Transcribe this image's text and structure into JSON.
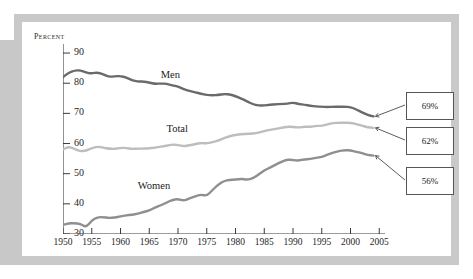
{
  "chart_data": {
    "type": "line",
    "title": "",
    "xlabel": "",
    "ylabel": "Percent",
    "xlim": [
      1950,
      2006
    ],
    "ylim": [
      30,
      93
    ],
    "ytick_labels": [
      "30",
      "40",
      "50",
      "60",
      "70",
      "80",
      "90"
    ],
    "yticks": [
      30,
      40,
      50,
      60,
      70,
      80,
      90
    ],
    "xtick_labels": [
      "1950",
      "1955",
      "1960",
      "1965",
      "1970",
      "1975",
      "1980",
      "1985",
      "1990",
      "1995",
      "2000",
      "2005"
    ],
    "xticks": [
      1950,
      1955,
      1960,
      1965,
      1970,
      1975,
      1980,
      1985,
      1990,
      1995,
      2000,
      2005
    ],
    "grid": false,
    "legend": "inline-labels",
    "x": [
      1950,
      1951,
      1952,
      1953,
      1954,
      1955,
      1956,
      1957,
      1958,
      1959,
      1960,
      1961,
      1962,
      1963,
      1964,
      1965,
      1966,
      1967,
      1968,
      1969,
      1970,
      1971,
      1972,
      1973,
      1974,
      1975,
      1976,
      1977,
      1978,
      1979,
      1980,
      1981,
      1982,
      1983,
      1984,
      1985,
      1986,
      1987,
      1988,
      1989,
      1990,
      1991,
      1992,
      1993,
      1994,
      1995,
      1996,
      1997,
      1998,
      1999,
      2000,
      2001,
      2002,
      2003,
      2004
    ],
    "series": [
      {
        "name": "Men",
        "color": "#6a6a6a",
        "label_x": 1967,
        "label_y": 82.5,
        "end_value": 69,
        "values": [
          82.0,
          83.5,
          84.2,
          84.3,
          83.5,
          83.2,
          83.6,
          82.9,
          82.1,
          82.3,
          82.4,
          81.9,
          81.0,
          80.5,
          80.6,
          80.2,
          79.8,
          79.9,
          79.8,
          79.3,
          78.9,
          78.0,
          77.4,
          77.0,
          76.5,
          76.1,
          76.0,
          76.1,
          76.4,
          76.3,
          75.7,
          74.9,
          74.0,
          73.0,
          72.6,
          72.6,
          72.9,
          73.0,
          73.1,
          73.2,
          73.6,
          73.1,
          72.9,
          72.5,
          72.3,
          72.2,
          72.1,
          72.2,
          72.2,
          72.2,
          72.1,
          71.3,
          70.4,
          69.4,
          69.0
        ]
      },
      {
        "name": "Total",
        "color": "#bdbdbd",
        "label_x": 1968,
        "label_y": 64.5,
        "end_value": 62,
        "values": [
          58.0,
          59.0,
          58.2,
          57.4,
          57.6,
          58.5,
          59.0,
          58.6,
          58.3,
          58.2,
          58.6,
          58.5,
          58.2,
          58.3,
          58.3,
          58.4,
          58.6,
          59.0,
          59.2,
          59.7,
          59.5,
          59.1,
          59.4,
          59.8,
          60.2,
          60.0,
          60.4,
          61.0,
          61.8,
          62.4,
          62.9,
          63.1,
          63.2,
          63.3,
          63.6,
          64.1,
          64.6,
          64.8,
          65.2,
          65.6,
          65.5,
          65.3,
          65.6,
          65.5,
          65.9,
          65.8,
          66.4,
          66.8,
          66.9,
          66.9,
          66.9,
          66.5,
          65.9,
          65.4,
          65.2
        ]
      },
      {
        "name": "Women",
        "color": "#8f8f8f",
        "label_x": 1963,
        "label_y": 45.5,
        "end_value": 56,
        "values": [
          33.0,
          33.5,
          33.6,
          33.4,
          32.2,
          34.5,
          35.6,
          35.6,
          35.3,
          35.5,
          35.8,
          36.2,
          36.4,
          36.7,
          37.3,
          37.8,
          38.8,
          39.5,
          40.4,
          41.3,
          41.6,
          41.0,
          41.8,
          42.5,
          43.1,
          42.6,
          44.6,
          46.4,
          47.6,
          48.0,
          48.0,
          48.3,
          48.0,
          48.4,
          49.7,
          51.1,
          52.0,
          53.0,
          54.0,
          54.7,
          54.5,
          54.3,
          54.8,
          54.8,
          55.3,
          55.5,
          56.3,
          57.0,
          57.5,
          57.8,
          57.7,
          57.3,
          56.8,
          56.2,
          56.0
        ]
      }
    ],
    "callouts": [
      {
        "label": "69%",
        "series": "Men"
      },
      {
        "label": "62%",
        "series": "Total"
      },
      {
        "label": "56%",
        "series": "Women"
      }
    ]
  }
}
